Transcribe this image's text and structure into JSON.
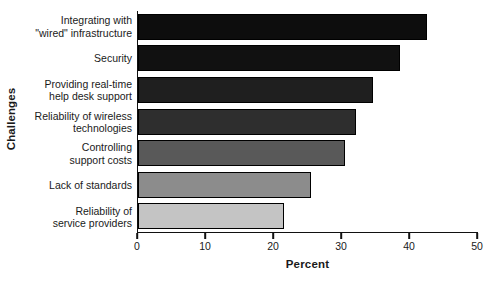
{
  "chart_data": {
    "type": "bar",
    "orientation": "horizontal",
    "title": "",
    "xlabel": "Percent",
    "ylabel": "Challenges",
    "xlim": [
      0,
      50
    ],
    "xticks": [
      0,
      10,
      20,
      30,
      40,
      50
    ],
    "xtick_labels": [
      "0",
      "10",
      "20",
      "30",
      "40",
      "50"
    ],
    "grid": false,
    "legend": "none",
    "categories": [
      "Integrating with\n\"wired\" infrastructure",
      "Security",
      "Providing real-time\nhelp desk support",
      "Reliability of wireless\ntechnologies",
      "Controlling\nsupport costs",
      "Lack of standards",
      "Reliability of\nservice providers"
    ],
    "values": [
      42.5,
      38.5,
      34.5,
      32,
      30.5,
      25.5,
      21.5
    ],
    "bar_colors": [
      "#0d0d0d",
      "#111111",
      "#1f1f1f",
      "#2e2e2e",
      "#595959",
      "#8c8c8c",
      "#c4c4c4"
    ],
    "bar_edge_color": "#000000",
    "axis_color": "#111111",
    "background_color": "#ffffff"
  }
}
